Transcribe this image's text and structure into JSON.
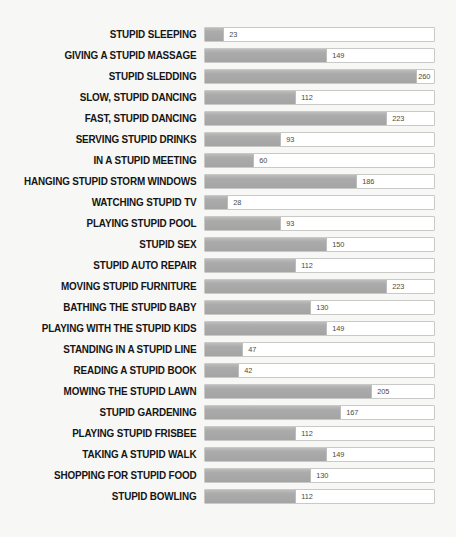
{
  "chart_data": {
    "type": "bar",
    "orientation": "horizontal",
    "title": "",
    "subtitle": "",
    "xlabel": "",
    "ylabel": "",
    "grid": false,
    "legend": null,
    "axis_visible": false,
    "tick_labels": [],
    "value_label_position": "end-of-bar",
    "xlim": [
      0,
      283
    ],
    "colors": {
      "background": "#f7f7f5",
      "bar_fill": "#a8a8a8",
      "bar_track": "#ffffff",
      "bar_border": "#c9c9c7",
      "label_text": "#151515",
      "value_text": "#4a4a4a"
    },
    "categories": [
      "STUPID SLEEPING",
      "GIVING A STUPID MASSAGE",
      "STUPID SLEDDING",
      "SLOW, STUPID DANCING",
      "FAST, STUPID DANCING",
      "SERVING STUPID DRINKS",
      "IN A STUPID MEETING",
      "HANGING STUPID STORM WINDOWS",
      "WATCHING STUPID TV",
      "PLAYING STUPID POOL",
      "STUPID SEX",
      "STUPID AUTO REPAIR",
      "MOVING STUPID FURNITURE",
      "BATHING THE STUPID BABY",
      "PLAYING WITH THE STUPID KIDS",
      "STANDING IN A STUPID LINE",
      "READING A STUPID BOOK",
      "MOWING THE STUPID LAWN",
      "STUPID GARDENING",
      "PLAYING STUPID FRISBEE",
      "TAKING A STUPID WALK",
      "SHOPPING FOR STUPID FOOD",
      "STUPID BOWLING"
    ],
    "values": [
      23,
      149,
      260,
      112,
      223,
      93,
      60,
      186,
      28,
      93,
      150,
      112,
      223,
      130,
      149,
      47,
      42,
      205,
      167,
      112,
      149,
      130,
      112
    ]
  }
}
